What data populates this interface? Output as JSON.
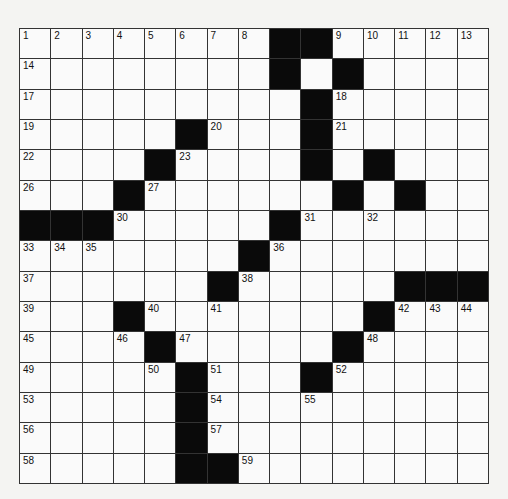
{
  "puzzle": {
    "rows": 15,
    "cols": 15,
    "grid": [
      "........##.....",
      "........#.#....",
      ".........#.....",
      ".....#...#.....",
      "....#....#.#...",
      "...#......#.#..",
      "###.....#......",
      ".......#.......",
      "......#.....###",
      "...#.......#...",
      "....#.....#....",
      ".....#...#.....",
      ".....#.........",
      ".....#.........",
      ".....##........"
    ],
    "numbers": [
      {
        "r": 0,
        "c": 0,
        "n": "1"
      },
      {
        "r": 0,
        "c": 1,
        "n": "2"
      },
      {
        "r": 0,
        "c": 2,
        "n": "3"
      },
      {
        "r": 0,
        "c": 3,
        "n": "4"
      },
      {
        "r": 0,
        "c": 4,
        "n": "5"
      },
      {
        "r": 0,
        "c": 5,
        "n": "6"
      },
      {
        "r": 0,
        "c": 6,
        "n": "7"
      },
      {
        "r": 0,
        "c": 7,
        "n": "8"
      },
      {
        "r": 0,
        "c": 10,
        "n": "9"
      },
      {
        "r": 0,
        "c": 11,
        "n": "10"
      },
      {
        "r": 0,
        "c": 12,
        "n": "11"
      },
      {
        "r": 0,
        "c": 13,
        "n": "12"
      },
      {
        "r": 0,
        "c": 14,
        "n": "13"
      },
      {
        "r": 1,
        "c": 0,
        "n": "14"
      },
      {
        "r": 1,
        "c": 8,
        "n": "15"
      },
      {
        "r": 1,
        "c": 10,
        "n": "16"
      },
      {
        "r": 2,
        "c": 0,
        "n": "17"
      },
      {
        "r": 2,
        "c": 10,
        "n": "18"
      },
      {
        "r": 3,
        "c": 0,
        "n": "19"
      },
      {
        "r": 3,
        "c": 6,
        "n": "20"
      },
      {
        "r": 3,
        "c": 10,
        "n": "21"
      },
      {
        "r": 4,
        "c": 0,
        "n": "22"
      },
      {
        "r": 4,
        "c": 5,
        "n": "23"
      },
      {
        "r": 4,
        "c": 9,
        "n": "24"
      },
      {
        "r": 4,
        "c": 11,
        "n": "25"
      },
      {
        "r": 5,
        "c": 0,
        "n": "26"
      },
      {
        "r": 5,
        "c": 4,
        "n": "27"
      },
      {
        "r": 5,
        "c": 10,
        "n": "28"
      },
      {
        "r": 5,
        "c": 12,
        "n": "29"
      },
      {
        "r": 6,
        "c": 3,
        "n": "30"
      },
      {
        "r": 6,
        "c": 9,
        "n": "31"
      },
      {
        "r": 6,
        "c": 11,
        "n": "32"
      },
      {
        "r": 7,
        "c": 0,
        "n": "33"
      },
      {
        "r": 7,
        "c": 1,
        "n": "34"
      },
      {
        "r": 7,
        "c": 2,
        "n": "35"
      },
      {
        "r": 7,
        "c": 8,
        "n": "36"
      },
      {
        "r": 8,
        "c": 0,
        "n": "37"
      },
      {
        "r": 8,
        "c": 7,
        "n": "38"
      },
      {
        "r": 9,
        "c": 0,
        "n": "39"
      },
      {
        "r": 9,
        "c": 4,
        "n": "40"
      },
      {
        "r": 9,
        "c": 6,
        "n": "41"
      },
      {
        "r": 9,
        "c": 12,
        "n": "42"
      },
      {
        "r": 9,
        "c": 13,
        "n": "43"
      },
      {
        "r": 9,
        "c": 14,
        "n": "44"
      },
      {
        "r": 10,
        "c": 0,
        "n": "45"
      },
      {
        "r": 10,
        "c": 3,
        "n": "46"
      },
      {
        "r": 10,
        "c": 5,
        "n": "47"
      },
      {
        "r": 10,
        "c": 11,
        "n": "48"
      },
      {
        "r": 11,
        "c": 0,
        "n": "49"
      },
      {
        "r": 11,
        "c": 4,
        "n": "50"
      },
      {
        "r": 11,
        "c": 6,
        "n": "51"
      },
      {
        "r": 11,
        "c": 10,
        "n": "52"
      },
      {
        "r": 12,
        "c": 0,
        "n": "53"
      },
      {
        "r": 12,
        "c": 6,
        "n": "54"
      },
      {
        "r": 12,
        "c": 9,
        "n": "55"
      },
      {
        "r": 13,
        "c": 0,
        "n": "56"
      },
      {
        "r": 13,
        "c": 6,
        "n": "57"
      },
      {
        "r": 14,
        "c": 0,
        "n": "58"
      },
      {
        "r": 14,
        "c": 7,
        "n": "59"
      }
    ]
  }
}
